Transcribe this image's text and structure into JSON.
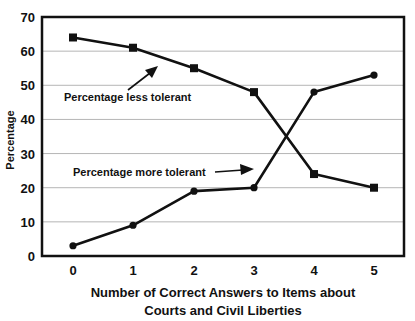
{
  "chart_data": {
    "type": "line",
    "title": "",
    "xlabel": "Number of Correct Answers to Items about Courts and Civil Liberties",
    "xlabel_lines": [
      "Number of Correct Answers to Items about",
      "Courts and Civil Liberties"
    ],
    "ylabel": "Percentage",
    "x": [
      0,
      1,
      2,
      3,
      4,
      5
    ],
    "categories": [
      "0",
      "1",
      "2",
      "3",
      "4",
      "5"
    ],
    "ylim": [
      0,
      70
    ],
    "yticks": [
      0,
      10,
      20,
      30,
      40,
      50,
      60,
      70
    ],
    "grid": true,
    "legend_position": "inline annotations with arrows",
    "series": [
      {
        "name": "Percentage less tolerant",
        "marker": "square",
        "values": [
          64,
          61,
          55,
          48,
          24,
          20
        ]
      },
      {
        "name": "Percentage more tolerant",
        "marker": "circle",
        "values": [
          3,
          9,
          19,
          20,
          48,
          53
        ]
      }
    ],
    "annotations": [
      {
        "text": "Percentage less tolerant",
        "series": 0
      },
      {
        "text": "Percentage more tolerant",
        "series": 1
      }
    ]
  },
  "colors": {
    "line": "#111111",
    "grid": "#b5b5b5",
    "axis": "#111111",
    "background": "#ffffff"
  }
}
